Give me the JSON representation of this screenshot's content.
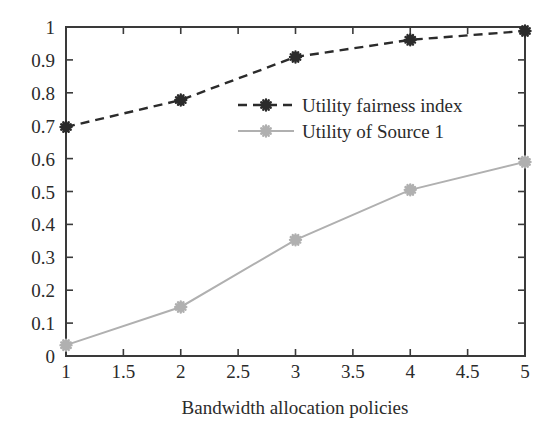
{
  "chart_data": {
    "type": "line",
    "title": "",
    "xlabel": "Bandwidth allocation policies",
    "ylabel": "",
    "x": [
      1,
      2,
      3,
      4,
      5
    ],
    "xlim": [
      1,
      5
    ],
    "ylim": [
      0,
      1
    ],
    "grid": false,
    "legend_position": "center-right-upper",
    "xticks": [
      "1",
      "1.5",
      "2",
      "2.5",
      "3",
      "3.5",
      "4",
      "4.5",
      "5"
    ],
    "xtick_values": [
      1,
      1.5,
      2,
      2.5,
      3,
      3.5,
      4,
      4.5,
      5
    ],
    "yticks": [
      "0",
      "0.1",
      "0.2",
      "0.3",
      "0.4",
      "0.5",
      "0.6",
      "0.7",
      "0.8",
      "0.9",
      "1"
    ],
    "ytick_values": [
      0,
      0.1,
      0.2,
      0.3,
      0.4,
      0.5,
      0.6,
      0.7,
      0.8,
      0.9,
      1
    ],
    "series": [
      {
        "name": "Utility fairness index",
        "values": [
          0.696,
          0.778,
          0.909,
          0.961,
          0.988
        ],
        "color": "#2b2b2b",
        "style": "dashed",
        "marker": "star"
      },
      {
        "name": "Utility of Source 1",
        "values": [
          0.033,
          0.149,
          0.353,
          0.505,
          0.59
        ],
        "color": "#b0b0b0",
        "style": "solid",
        "marker": "star"
      }
    ]
  },
  "axis": {
    "frame_color": "#3a3a3a",
    "xlabel": "Bandwidth allocation policies"
  },
  "legend": {
    "entries": [
      {
        "label": "Utility fairness index",
        "color": "#2b2b2b",
        "style": "dashed"
      },
      {
        "label": "Utility of Source 1",
        "color": "#b0b0b0",
        "style": "solid"
      }
    ]
  }
}
